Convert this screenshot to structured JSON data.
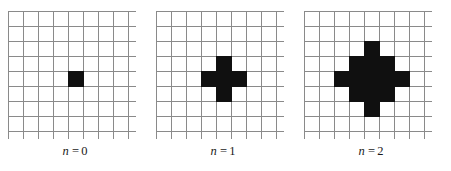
{
  "figure": {
    "grid_size": 9,
    "grid_line_color": "#8a8a8a",
    "filled_cell_color": "#101010",
    "empty_cell_color": "#ffffff",
    "background_color": "#ffffff"
  },
  "panels": [
    {
      "caption_variable": "n",
      "caption_equals": "=",
      "caption_value": "0",
      "filled_cells": [
        [
          4,
          4
        ]
      ],
      "filled_count": 1
    },
    {
      "caption_variable": "n",
      "caption_equals": "=",
      "caption_value": "1",
      "filled_cells": [
        [
          3,
          4
        ],
        [
          4,
          3
        ],
        [
          4,
          4
        ],
        [
          4,
          5
        ],
        [
          5,
          4
        ]
      ],
      "filled_count": 5
    },
    {
      "caption_variable": "n",
      "caption_equals": "=",
      "caption_value": "2",
      "filled_cells": [
        [
          2,
          4
        ],
        [
          3,
          3
        ],
        [
          3,
          4
        ],
        [
          3,
          5
        ],
        [
          4,
          2
        ],
        [
          4,
          3
        ],
        [
          4,
          4
        ],
        [
          4,
          5
        ],
        [
          4,
          6
        ],
        [
          5,
          3
        ],
        [
          5,
          4
        ],
        [
          5,
          5
        ],
        [
          6,
          4
        ]
      ],
      "filled_count": 13
    }
  ],
  "chart_data": {
    "type": "heatmap",
    "title": "",
    "xlabel": "",
    "ylabel": "",
    "categories": [
      "n = 0",
      "n = 1",
      "n = 2"
    ],
    "values": [
      1,
      5,
      13
    ],
    "grid": true,
    "legend": "none"
  }
}
